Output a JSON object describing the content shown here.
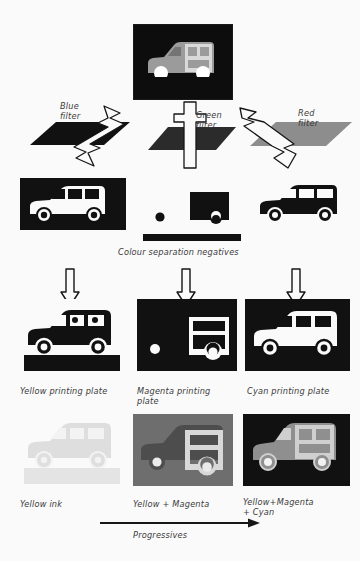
{
  "diagram": {
    "background_color": "#fafafa"
  },
  "original": {
    "name": "original-photo",
    "background_color": "#0d0d0d",
    "subject_color": "#9a9a9a",
    "subject": "estate-car"
  },
  "filters": [
    {
      "id": "blue-filter",
      "label": "Blue\nfilter",
      "plate_color": "#111111",
      "arrow_type": "zigzag-left"
    },
    {
      "id": "green-filter",
      "label": "Green\nfilter",
      "plate_color": "#2b2b2b",
      "arrow_type": "straight-down"
    },
    {
      "id": "red-filter",
      "label": "Red\nfilter",
      "plate_color": "#8d8d8d",
      "arrow_type": "zigzag-right"
    }
  ],
  "negatives": {
    "caption": "Colour separation negatives",
    "items": [
      {
        "id": "blue-separation-negative",
        "background_color": "#111111",
        "car_color": "#fafafa"
      },
      {
        "id": "green-separation-negative",
        "background_color": "#fafafa",
        "car_color": "#111111"
      },
      {
        "id": "red-separation-negative",
        "background_color": "#fafafa",
        "car_color": "#111111"
      }
    ]
  },
  "plates": [
    {
      "id": "yellow-printing-plate",
      "label": "Yellow printing plate",
      "background_color": "#fafafa",
      "car_color": "#111111"
    },
    {
      "id": "magenta-printing-plate",
      "label": "Magenta printing\nplate",
      "background_color": "#111111",
      "car_color": "#fafafa"
    },
    {
      "id": "cyan-printing-plate",
      "label": "Cyan printing plate",
      "background_color": "#111111",
      "car_color": "#fafafa"
    }
  ],
  "progressives": [
    {
      "id": "yellow-ink-proof",
      "label": "Yellow ink",
      "background_color": "#fafafa",
      "car_color": "#dedede"
    },
    {
      "id": "yellow-magenta-proof",
      "label": "Yellow + Magenta",
      "background_color": "#6e6e6e",
      "car_color": "#4a4a4a",
      "highlight_color": "#d8d8d8"
    },
    {
      "id": "yellow-magenta-cyan-proof",
      "label": "Yellow+Magenta\n+ Cyan",
      "background_color": "#111111",
      "car_color": "#8f8f8f",
      "highlight_color": "#cfcfcf"
    }
  ],
  "axis": {
    "label": "Progressives",
    "direction": "left-to-right"
  },
  "icons": {
    "zigzag_arrow": "zigzag-arrow-icon",
    "straight_arrow": "straight-arrow-icon",
    "down_arrow": "down-arrow-icon",
    "right_arrow": "right-arrow-icon"
  }
}
